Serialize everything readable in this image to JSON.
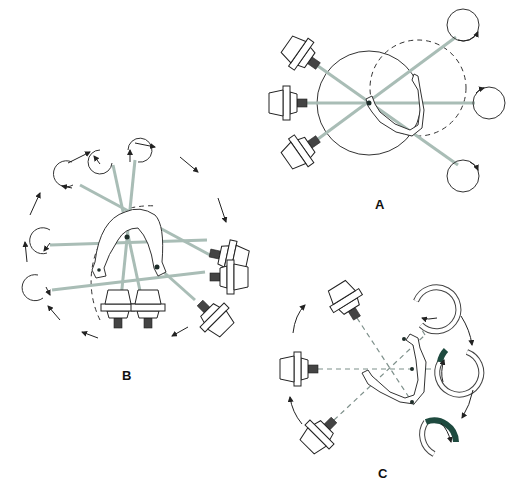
{
  "figure": {
    "panels": [
      {
        "id": "A",
        "label": "A",
        "description": "Single rotation center: three x-ray tube positions rotate about one fixed center; detector circles opposite"
      },
      {
        "id": "B",
        "label": "B",
        "description": "Two rotation centers (one per side of the mandible) with a central shared center; tube and detector rotate around the arch"
      },
      {
        "id": "C",
        "label": "C",
        "description": "Continuously moving rotation center following the dental arch; detector arcs with dark highlighted segments"
      }
    ],
    "colors": {
      "beam": "#a9bdb6",
      "line": "#333333",
      "detector_highlight": "#1e4a3f",
      "background": "#ffffff"
    },
    "icons": [
      "xray-tube-icon",
      "detector-circle-icon",
      "rotation-arrow-icon",
      "mandible-outline-icon",
      "rotation-center-dot-icon"
    ]
  }
}
